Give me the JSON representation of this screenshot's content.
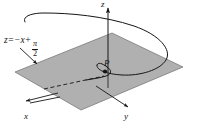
{
  "figure": {
    "background_color": "#ffffff",
    "line_color": "#161616",
    "plane_fill_color": "#b0b0b0",
    "plane_edge_color": "#5a5a5a"
  },
  "axes": {
    "z": {
      "label": "z",
      "icon": "arrow-up-icon"
    },
    "x": {
      "label": "x",
      "icon": "arrow-left-icon"
    },
    "y": {
      "label": "y",
      "icon": "arrow-down-right-icon"
    }
  },
  "plane": {
    "equation": {
      "lhs": "z",
      "equals": "=",
      "term": "−x",
      "plus": "+",
      "fraction_numerator": "π",
      "fraction_denominator": "2"
    },
    "leader": {
      "icon": "leader-arrow-icon"
    }
  },
  "point": {
    "label": "P",
    "marker": "filled-dot-icon"
  },
  "curve": {
    "name": "helix-curve",
    "style": "solid"
  },
  "projection": {
    "name": "dashed-projection-line",
    "style": "dashed"
  }
}
